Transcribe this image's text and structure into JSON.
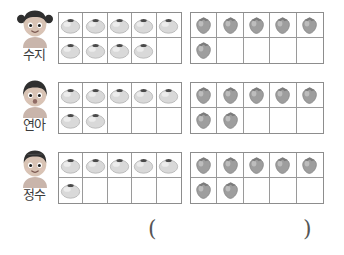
{
  "worksheet": {
    "fruit_labels": {
      "apple": "apple-counter",
      "strawberry": "strawberry-counter"
    },
    "colors": {
      "apple_body": "#d9d9d9",
      "apple_shade": "#b4b4b4",
      "apple_stem": "#4a4a4a",
      "strawberry_body": "#9e9e9e",
      "strawberry_shade": "#7c7c7c",
      "grid_line": "#9a9a9a",
      "grid_border": "#8d8d8d",
      "text": "#3b3b3b",
      "skin": "#d8c3b4",
      "hair": "#2f2f2f",
      "shirt": "#c9b5ab"
    },
    "frame": {
      "columns": 5,
      "rows": 2,
      "capacity": 10
    },
    "students": [
      {
        "name": "수지",
        "avatar": "girl-pigtails-avatar",
        "apples": 9,
        "strawberries": 6
      },
      {
        "name": "연아",
        "avatar": "girl-bob-avatar",
        "apples": 7,
        "strawberries": 7
      },
      {
        "name": "정수",
        "avatar": "boy-avatar",
        "apples": 6,
        "strawberries": 7
      }
    ],
    "answer": {
      "open_paren": "(",
      "close_paren": ")",
      "value": ""
    }
  },
  "chart_data": {
    "type": "table",
    "title": "",
    "categories": [
      "수지",
      "연아",
      "정수"
    ],
    "series": [
      {
        "name": "apple-counter",
        "values": [
          9,
          7,
          6
        ]
      },
      {
        "name": "strawberry-counter",
        "values": [
          6,
          7,
          7
        ]
      }
    ],
    "xlabel": "",
    "ylabel": "",
    "ylim": [
      0,
      10
    ],
    "grid": true,
    "legend": "none"
  }
}
